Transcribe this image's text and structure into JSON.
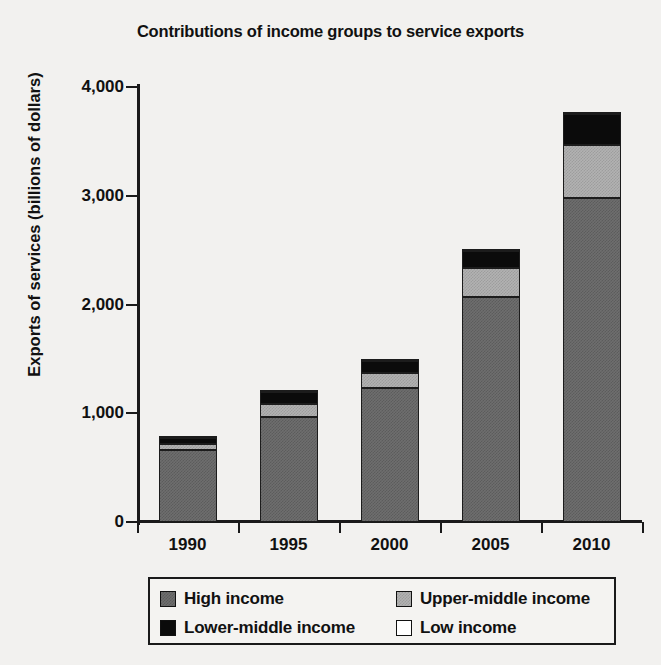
{
  "chart_data": {
    "type": "bar",
    "subtype": "stacked-bar",
    "title": "Contributions of income groups to service exports",
    "xlabel": "",
    "ylabel": "Exports of services (billions of dollars)",
    "categories": [
      "1990",
      "1995",
      "2000",
      "2005",
      "2010"
    ],
    "ylim": [
      0,
      4000
    ],
    "yticks": [
      0,
      1000,
      2000,
      3000,
      4000
    ],
    "ytick_labels": [
      "0",
      "1,000",
      "2,000",
      "3,000",
      "4,000"
    ],
    "grid": false,
    "legend_position": "bottom",
    "series": [
      {
        "name": "High income",
        "color": "#6e6e6e",
        "swatch": "dark-gray",
        "values": [
          665,
          965,
          1230,
          2070,
          2980
        ]
      },
      {
        "name": "Upper-middle income",
        "color": "#b2b2b2",
        "swatch": "light-gray",
        "values": [
          50,
          120,
          140,
          265,
          490
        ]
      },
      {
        "name": "Lower-middle income",
        "color": "#0b0b0b",
        "swatch": "black",
        "values": [
          60,
          110,
          110,
          155,
          285
        ]
      },
      {
        "name": "Low income",
        "color": "#ffffff",
        "swatch": "white",
        "values": [
          5,
          5,
          5,
          5,
          5
        ]
      }
    ],
    "totals": [
      780,
      1200,
      1485,
      2495,
      3760
    ]
  },
  "axes": {
    "y_title": "Exports of services (billions of dollars)",
    "y_tick_labels": [
      "4,000",
      "3,000",
      "2,000",
      "1,000",
      "0"
    ],
    "x_tick_labels": [
      "1990",
      "1995",
      "2000",
      "2005",
      "2010"
    ]
  },
  "legend": {
    "entries": [
      {
        "label": "High income",
        "swatch": "dark-gray"
      },
      {
        "label": "Upper-middle income",
        "swatch": "light-gray"
      },
      {
        "label": "Lower-middle income",
        "swatch": "black"
      },
      {
        "label": "Low income",
        "swatch": "white"
      }
    ]
  }
}
